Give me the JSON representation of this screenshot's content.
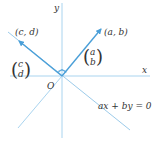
{
  "diagram": {
    "axes": {
      "x_label": "x",
      "y_label": "y",
      "origin_label": "O"
    },
    "vectors": [
      {
        "id": "ab",
        "point_label": "(a, b)",
        "column_top": "a",
        "column_bottom": "b"
      },
      {
        "id": "cd",
        "point_label": "(c, d)",
        "column_top": "c",
        "column_bottom": "d"
      }
    ],
    "line_equation": "ax + by = 0",
    "colors": {
      "axis": "#a9d4ef",
      "vector": "#4a9fd8",
      "line": "#9ccbea",
      "text": "#333333"
    }
  }
}
